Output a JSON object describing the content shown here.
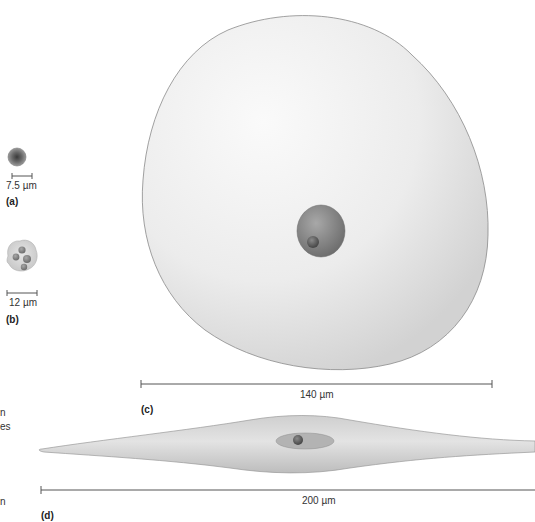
{
  "panels": {
    "a": {
      "label": "(a)",
      "scale": "7.5 µm",
      "description": "small round cell with dark center"
    },
    "b": {
      "label": "(b)",
      "scale": "12 µm",
      "description": "cell with multilobed nucleus"
    },
    "c": {
      "label": "(c)",
      "scale": "140 µm",
      "description": "large round cell with nucleus and nucleolus"
    },
    "d": {
      "label": "(d)",
      "scale": "200 µm",
      "description": "elongated spindle-shaped cell with nucleus"
    }
  },
  "cropped_text_fragments": [
    "n",
    "es",
    "n"
  ],
  "colors": {
    "background": "#ffffff",
    "cell_fill": "#e6e6e6",
    "cell_outline": "#8a8a8a",
    "nucleus": "#8c8c8c",
    "nucleolus": "#5e5e5e",
    "scale_bar": "#555555"
  }
}
